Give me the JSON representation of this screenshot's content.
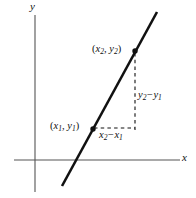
{
  "figure": {
    "name": "slope-of-a-line-diagram",
    "background_color": "#ffffff",
    "ink_color": "#111111",
    "axis_color": "#555555",
    "width": 196,
    "height": 198
  },
  "axes": {
    "y_label": "y",
    "x_label": "x",
    "x_axis": {
      "y": 160,
      "x_start": 14,
      "x_end": 180
    },
    "y_axis": {
      "x": 35,
      "y_start": 15,
      "y_end": 192
    }
  },
  "line": {
    "name": "secant-line",
    "x1": 62,
    "y1": 186,
    "x2": 157,
    "y2": 12,
    "stroke_width": 2.6
  },
  "points": [
    {
      "id": "point1",
      "label_prefix": "(",
      "label_var1": "x",
      "label_sub1": "1",
      "label_sep": ", ",
      "label_var2": "y",
      "label_sub2": "1",
      "label_suffix": ")",
      "cx": 93,
      "cy": 129
    },
    {
      "id": "point2",
      "label_prefix": "(",
      "label_var1": "x",
      "label_sub1": "2",
      "label_sep": ", ",
      "label_var2": "y",
      "label_sub2": "2",
      "label_suffix": ")",
      "cx": 135,
      "cy": 51
    }
  ],
  "deltas": {
    "rise": {
      "var1": "y",
      "sub1": "2",
      "operator": "−",
      "var2": "y",
      "sub2": "1",
      "dash_x": 135,
      "dash_y_start": 53,
      "dash_y_end": 130
    },
    "run": {
      "var1": "x",
      "sub1": "2",
      "operator": "−",
      "var2": "x",
      "sub2": "1",
      "dash_y": 128,
      "dash_x_start": 94,
      "dash_x_end": 135
    }
  }
}
